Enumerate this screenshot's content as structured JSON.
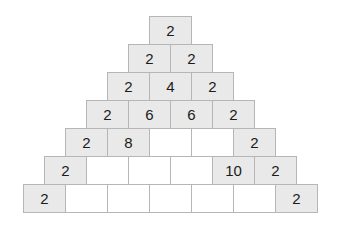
{
  "figure": {
    "type": "number-pyramid",
    "background_color": "#ffffff",
    "filled_cell_color": "#e9e9e9",
    "empty_cell_color": "#ffffff",
    "border_color": "#b6b6b6",
    "text_color": "#1b1b1b",
    "row_count": 7,
    "cell_width_px": 43,
    "cell_height_px": 29
  },
  "chart_data": {
    "type": "table",
    "title": "",
    "xlabel": "",
    "ylabel": "",
    "rows": [
      {
        "index": 1,
        "cells": [
          "2"
        ]
      },
      {
        "index": 2,
        "cells": [
          "2",
          "2"
        ]
      },
      {
        "index": 3,
        "cells": [
          "2",
          "4",
          "2"
        ]
      },
      {
        "index": 4,
        "cells": [
          "2",
          "6",
          "6",
          "2"
        ]
      },
      {
        "index": 5,
        "cells": [
          "2",
          "8",
          "",
          "",
          "2"
        ]
      },
      {
        "index": 6,
        "cells": [
          "2",
          "",
          "",
          "",
          "10",
          "2"
        ]
      },
      {
        "index": 7,
        "cells": [
          "2",
          "",
          "",
          "",
          "",
          "",
          "2"
        ]
      }
    ]
  }
}
